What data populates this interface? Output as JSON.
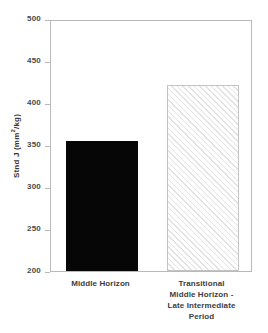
{
  "chart_data": {
    "type": "bar",
    "title": "",
    "xlabel": "",
    "ylabel": "Stnd J (mm2/kg)",
    "ylabel_parts": {
      "prefix": "Stnd J (mm",
      "exponent": "2",
      "suffix": "/kg)"
    },
    "categories": [
      "Middle Horizon",
      "Transitional Middle Horizon - Late Intermediate Period"
    ],
    "category_lines": [
      [
        "Middle Horizon"
      ],
      [
        "Transitional",
        "Middle Horizon -",
        "Late Intermediate",
        "Period"
      ]
    ],
    "values": [
      355,
      422
    ],
    "ylim": [
      200,
      500
    ],
    "yticks": [
      500,
      450,
      400,
      350,
      300,
      250,
      200
    ],
    "ytick_labels": [
      "500",
      "450",
      "400",
      "350",
      "300",
      "250",
      "200"
    ],
    "grid": false,
    "legend": null,
    "series": [
      {
        "name": "Stnd J",
        "values": [
          355,
          422
        ],
        "styles": [
          "solid-black",
          "diagonal-hatch"
        ]
      }
    ],
    "colors": {
      "bar_solid": "#060606",
      "bar_hatch_line": "#e3e3e3",
      "bar_hatch_background": "#ffffff",
      "bar_hatch_border": "#c4c4c4",
      "axis": "#b9b9b9",
      "text": "#3d3d3d",
      "background": "#ffffff"
    }
  }
}
